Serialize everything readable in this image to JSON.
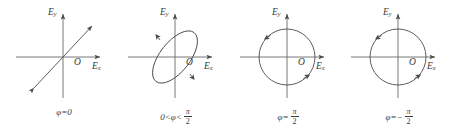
{
  "figure": {
    "background_color": "#ffffff",
    "line_color": "#4a4a4a",
    "text_color": "#3a3a3a",
    "axis_label_y": "E",
    "axis_label_y_sub": "y",
    "axis_label_x": "E",
    "axis_label_x_sub": "x",
    "origin_label": "O"
  },
  "panels": [
    {
      "id": "panel-linear-0",
      "shape": "line",
      "caption_prefix": "φ=0",
      "caption_numerator": "",
      "caption_denominator": "",
      "caption_full": "φ=0",
      "description": "linear-polarization-45-degree-line"
    },
    {
      "id": "panel-elliptical",
      "shape": "ellipse",
      "caption_prefix": "0<φ<",
      "caption_numerator": "π",
      "caption_denominator": "2",
      "caption_full": "0<φ<π/2",
      "description": "elliptical-polarization-tilted-ellipse"
    },
    {
      "id": "panel-circular-positive",
      "shape": "circle",
      "caption_prefix": "φ=",
      "caption_numerator": "π",
      "caption_denominator": "2",
      "caption_full": "φ=π/2",
      "description": "circular-polarization-left"
    },
    {
      "id": "panel-circular-negative",
      "shape": "circle",
      "caption_prefix": "φ=−",
      "caption_numerator": "π",
      "caption_denominator": "2",
      "caption_full": "φ=−π/2",
      "description": "circular-polarization-right"
    }
  ]
}
